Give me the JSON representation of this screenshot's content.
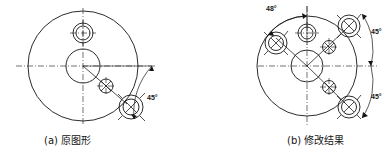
{
  "figure": {
    "title_bar": "",
    "background_color": "#ffffff",
    "line_color": "#141414",
    "panels": [
      {
        "id": "original",
        "caption": "(a) 原图形",
        "caption_label": "(a)",
        "caption_name": "原图形",
        "annotations": [
          {
            "name": "angle-45-right",
            "text": "45°",
            "value": 45,
            "unit": "degree"
          }
        ],
        "features": [
          {
            "name": "main-body-circle",
            "type": "circle"
          },
          {
            "name": "center-bore",
            "type": "circle"
          },
          {
            "name": "top-hole",
            "type": "crosshair-hole"
          },
          {
            "name": "inner-small-hole",
            "type": "crossed-circle"
          },
          {
            "name": "boss-bolt",
            "type": "bolt-boss"
          },
          {
            "name": "horizontal-centerline",
            "type": "center-line"
          },
          {
            "name": "vertical-centerline",
            "type": "center-line"
          }
        ]
      },
      {
        "id": "modified",
        "caption": "(b) 修改结果",
        "caption_label": "(b)",
        "caption_name": "修改结果",
        "annotations": [
          {
            "name": "angle-48-top",
            "text": "48°",
            "value": 48,
            "unit": "degree"
          },
          {
            "name": "angle-45-upper-right",
            "text": "45°",
            "value": 45,
            "unit": "degree"
          },
          {
            "name": "angle-45-lower-right",
            "text": "45°",
            "value": 45,
            "unit": "degree"
          }
        ],
        "features": [
          {
            "name": "main-body-circle",
            "type": "circle"
          },
          {
            "name": "center-bore",
            "type": "circle"
          },
          {
            "name": "top-hole",
            "type": "crosshair-hole"
          },
          {
            "name": "boss-bolt-array",
            "type": "bolt-boss",
            "count": 3
          },
          {
            "name": "inner-small-hole-array",
            "type": "crossed-circle",
            "count": 3
          },
          {
            "name": "horizontal-centerline",
            "type": "center-line"
          },
          {
            "name": "vertical-centerline",
            "type": "center-line"
          }
        ]
      }
    ]
  }
}
